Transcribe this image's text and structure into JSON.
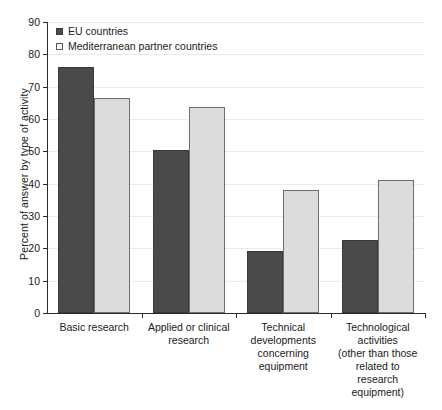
{
  "chart_data": {
    "type": "bar",
    "title": "",
    "subtitle": "",
    "xlabel": "",
    "ylabel": "Percent of answer by type of activity",
    "ylim": [
      0,
      90
    ],
    "ytick_step": 10,
    "yticks": [
      0,
      10,
      20,
      30,
      40,
      50,
      60,
      70,
      80,
      90
    ],
    "grid": true,
    "grid_axis": "y",
    "legend_position": "top-left",
    "categories": [
      "Basic research",
      "Applied or clinical research",
      "Technical developments concerning equipment",
      "Technological activities (other than those related to research equipment)"
    ],
    "category_label_lines": [
      [
        "Basic research"
      ],
      [
        "Applied or clinical",
        "research"
      ],
      [
        "Technical",
        "developments",
        "concerning",
        "equipment"
      ],
      [
        "Technological",
        "activities",
        "(other than those",
        "related to",
        "research",
        "equipment)"
      ]
    ],
    "series": [
      {
        "name": "EU countries",
        "color": "#4a4a4a",
        "values": [
          76.2,
          50.3,
          19.2,
          22.6
        ]
      },
      {
        "name": "Mediterranean partner countries",
        "color": "#dcdcdc",
        "values": [
          66.4,
          63.6,
          38.1,
          41.2
        ]
      }
    ]
  },
  "legend": {
    "items": [
      {
        "label": "EU countries",
        "swatch": "eu"
      },
      {
        "label": "Mediterranean partner countries",
        "swatch": "med"
      }
    ]
  },
  "axis": {
    "y_title": "Percent of answer by type of activity"
  }
}
